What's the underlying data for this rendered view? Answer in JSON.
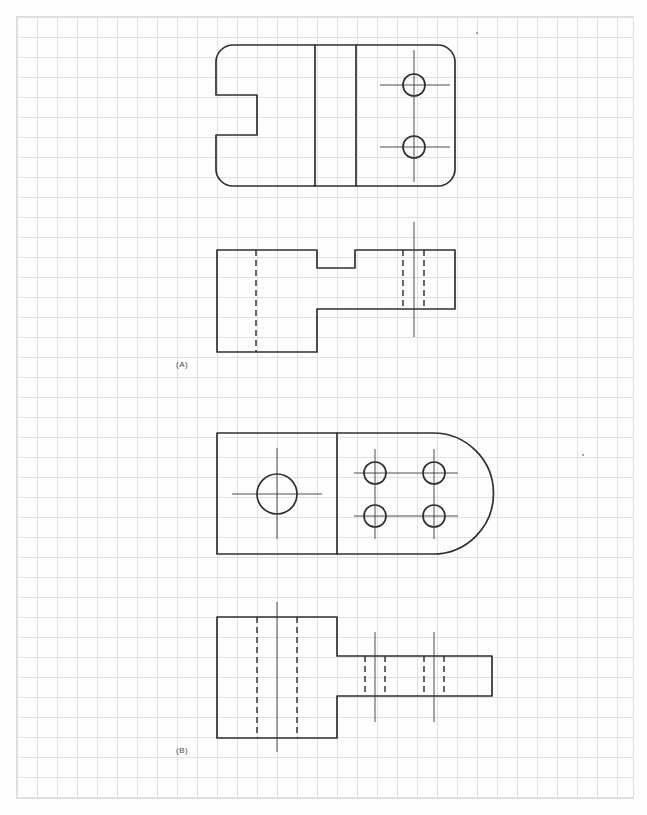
{
  "page": {
    "background": "#fdfdfd",
    "line_color": "#2f2f2f",
    "grid": {
      "color": "#e0e1e4",
      "spacing": 20,
      "area": {
        "x": 16,
        "y": 16,
        "w": 618,
        "h": 783
      }
    },
    "specks": [
      {
        "x": 477,
        "y": 33
      },
      {
        "x": 583,
        "y": 455
      }
    ]
  },
  "figures": [
    {
      "id": "a",
      "label": "(A)",
      "label_pos": {
        "x": 176,
        "y": 360
      },
      "views": [
        {
          "name": "top-view",
          "outlines": [
            "M 233 45 H 438 A 17 17 0 0 1 455 62 V 169 A 17 17 0 0 1 438 186 H 233 A 17 17 0 0 1 216 169 V 135 H 257 V 95 H 216 V 62 A 17 17 0 0 1 233 45 Z"
          ],
          "solid_lines": [
            [
              315,
              45,
              315,
              186
            ],
            [
              356,
              45,
              356,
              186
            ]
          ],
          "circles": [
            {
              "cx": 414,
              "cy": 85,
              "r": 11
            },
            {
              "cx": 414,
              "cy": 147,
              "r": 11
            }
          ],
          "center_lines": [
            [
              414,
              50,
              414,
              182
            ],
            [
              380,
              85,
              450,
              85
            ],
            [
              380,
              147,
              450,
              147
            ]
          ]
        },
        {
          "name": "front-view",
          "outlines": [
            "M 217 250 H 317 V 268 H 355 V 250 H 455 V 309 H 317 V 352 H 217 Z"
          ],
          "hidden_lines": [
            [
              256,
              250,
              256,
              352
            ],
            [
              403,
              250,
              403,
              309
            ],
            [
              424,
              250,
              424,
              309
            ]
          ],
          "center_lines": [
            [
              414,
              222,
              414,
              337
            ]
          ]
        }
      ]
    },
    {
      "id": "b",
      "label": "(B)",
      "label_pos": {
        "x": 176,
        "y": 746
      },
      "views": [
        {
          "name": "top-view",
          "outlines": [
            "M 217 433 H 433 A 60.5 60.5 0 0 1 433 554 H 217 Z"
          ],
          "solid_lines": [
            [
              337,
              433,
              337,
              554
            ]
          ],
          "circles": [
            {
              "cx": 277,
              "cy": 494,
              "r": 20
            },
            {
              "cx": 375,
              "cy": 473,
              "r": 11
            },
            {
              "cx": 434,
              "cy": 473,
              "r": 11
            },
            {
              "cx": 375,
              "cy": 516,
              "r": 11
            },
            {
              "cx": 434,
              "cy": 516,
              "r": 11
            }
          ],
          "center_lines": [
            [
              232,
              494,
              322,
              494
            ],
            [
              277,
              448,
              277,
              539
            ],
            [
              354,
              473,
              458,
              473
            ],
            [
              354,
              516,
              458,
              516
            ],
            [
              375,
              449,
              375,
              539
            ],
            [
              434,
              449,
              434,
              539
            ]
          ]
        },
        {
          "name": "front-view",
          "outlines": [
            "M 217 617 H 337 V 656 H 492 V 696 H 337 V 738 H 217 Z"
          ],
          "hidden_lines": [
            [
              257,
              617,
              257,
              738
            ],
            [
              297,
              617,
              297,
              738
            ],
            [
              365,
              656,
              365,
              696
            ],
            [
              385,
              656,
              385,
              696
            ],
            [
              424,
              656,
              424,
              696
            ],
            [
              444,
              656,
              444,
              696
            ]
          ],
          "center_lines": [
            [
              277,
              602,
              277,
              752
            ],
            [
              375,
              632,
              375,
              722
            ],
            [
              434,
              632,
              434,
              722
            ]
          ]
        }
      ]
    }
  ]
}
